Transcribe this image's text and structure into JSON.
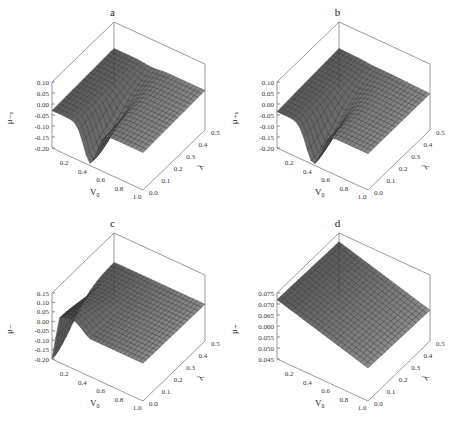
{
  "figure": {
    "panels": [
      "a",
      "b",
      "c",
      "d"
    ]
  },
  "chart_data": [
    {
      "type": "surface",
      "title": "a",
      "xlabel": "V0",
      "ylabel": "λ",
      "zlabel": "μ₋ₓ",
      "x_ticks": [
        "0.2",
        "0.4",
        "0.6",
        "0.8",
        "1.0"
      ],
      "y_ticks": [
        "0.0",
        "0.1",
        "0.2",
        "0.3",
        "0.4",
        "0.5"
      ],
      "z_ticks": [
        "0.10",
        "0.05",
        "0.00",
        "-0.05",
        "-0.10",
        "-0.15",
        "-0.20"
      ],
      "zlim": [
        -0.2,
        0.1
      ],
      "xlim": [
        0.0,
        1.0
      ],
      "ylim": [
        0.0,
        0.5
      ],
      "shape": "saddle dip near V0≈0.4, λ≈0.0 reaching ≈-0.19; surface ≈-0.03 elsewhere"
    },
    {
      "type": "surface",
      "title": "b",
      "xlabel": "V0",
      "ylabel": "λ",
      "zlabel": "μ₊ₓ",
      "x_ticks": [
        "0.2",
        "0.4",
        "0.6",
        "0.8",
        "1.0"
      ],
      "y_ticks": [
        "0.0",
        "0.1",
        "0.2",
        "0.3",
        "0.4",
        "0.5"
      ],
      "z_ticks": [
        "0.10",
        "0.05",
        "0.00",
        "-0.05",
        "-0.10",
        "-0.15",
        "-0.20"
      ],
      "zlim": [
        -0.2,
        0.1
      ],
      "xlim": [
        0.0,
        1.0
      ],
      "ylim": [
        0.0,
        0.5
      ],
      "shape": "dip near V0≈0.4, λ≈0.0 reaching ≈-0.20; ridge ≈-0.03 across λ"
    },
    {
      "type": "surface",
      "title": "c",
      "xlabel": "V0",
      "ylabel": "λ",
      "zlabel": "μ₋",
      "x_ticks": [
        "0.2",
        "0.4",
        "0.6",
        "0.8",
        "1.0"
      ],
      "y_ticks": [
        "0.0",
        "0.1",
        "0.2",
        "0.3",
        "0.4",
        "0.5"
      ],
      "z_ticks": [
        "0.15",
        "0.10",
        "0.05",
        "0.00",
        "-0.05",
        "-0.10",
        "-0.15",
        "-0.20"
      ],
      "zlim": [
        -0.2,
        0.15
      ],
      "xlim": [
        0.0,
        1.0
      ],
      "ylim": [
        0.0,
        0.5
      ],
      "shape": "peak ≈0.06 at small V0 & λ≈0, dropping to ≈-0.15; flat ≈0.00 elsewhere"
    },
    {
      "type": "surface",
      "title": "d",
      "xlabel": "V0",
      "ylabel": "λ",
      "zlabel": "μ₊",
      "x_ticks": [
        "0.2",
        "0.4",
        "0.6",
        "0.8",
        "1.0"
      ],
      "y_ticks": [
        "0.0",
        "0.1",
        "0.2",
        "0.3",
        "0.4",
        "0.5"
      ],
      "z_ticks": [
        "0.075",
        "0.070",
        "0.065",
        "0.060",
        "0.055",
        "0.050",
        "0.045"
      ],
      "zlim": [
        0.045,
        0.075
      ],
      "xlim": [
        0.0,
        1.0
      ],
      "ylim": [
        0.0,
        0.5
      ],
      "shape": "nearly planar, ≈0.072 at V0=0 decreasing to ≈0.060 at V0=1"
    }
  ]
}
